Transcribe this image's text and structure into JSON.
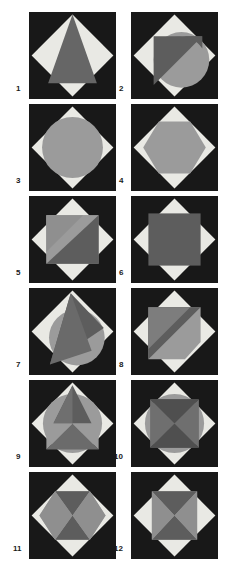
{
  "sheet": {
    "title": "Geometric figure plate",
    "columns": 2,
    "rows": 6,
    "panel_count": 12
  },
  "palette": {
    "background": "#181818",
    "page": "#ffffff",
    "light": "#e9e9e4",
    "light_alt": "#dedbd4",
    "mid_gray": "#9b9b9b",
    "mid_gray_2": "#8f8f8f",
    "dark_gray": "#666666",
    "dark_gray_2": "#5d5d5d",
    "label": "#1a1a1a"
  },
  "panels": [
    {
      "number": "1",
      "label": "1",
      "x": 29,
      "y": 12,
      "description": "dark square with light diamond and dark gray triangle",
      "shapes": [
        "diamond",
        "triangle"
      ]
    },
    {
      "number": "2",
      "label": "2",
      "x": 131,
      "y": 12,
      "description": "diamond with gray circle overlapped by dark gray triangle",
      "shapes": [
        "diamond",
        "circle",
        "triangle"
      ]
    },
    {
      "number": "3",
      "label": "3",
      "x": 29,
      "y": 104,
      "description": "diamond with large gray circle inscribed",
      "shapes": [
        "diamond",
        "circle"
      ]
    },
    {
      "number": "4",
      "label": "4",
      "x": 131,
      "y": 104,
      "description": "diamond with gray hexagon inscribed",
      "shapes": [
        "diamond",
        "hexagon"
      ]
    },
    {
      "number": "5",
      "label": "5",
      "x": 29,
      "y": 196,
      "description": "diamond with gray square split by diagonal band",
      "shapes": [
        "diamond",
        "square",
        "diagonal-band"
      ]
    },
    {
      "number": "6",
      "label": "6",
      "x": 131,
      "y": 196,
      "description": "diamond with dark gray square inscribed",
      "shapes": [
        "diamond",
        "square"
      ]
    },
    {
      "number": "7",
      "label": "7",
      "x": 29,
      "y": 288,
      "description": "diamond with gray circle overlapped by tall dark triangle",
      "shapes": [
        "diamond",
        "circle",
        "triangle"
      ]
    },
    {
      "number": "8",
      "label": "8",
      "x": 131,
      "y": 288,
      "description": "diamond with pentagon split diagonally in two grays",
      "shapes": [
        "diamond",
        "pentagon",
        "diagonal-band"
      ]
    },
    {
      "number": "9",
      "label": "9",
      "x": 29,
      "y": 380,
      "description": "diamond with circle and butterfly triangles",
      "shapes": [
        "diamond",
        "circle",
        "triangle",
        "triangle"
      ]
    },
    {
      "number": "10",
      "label": "10",
      "x": 131,
      "y": 380,
      "description": "diamond with circle and bowtie hourglass triangles",
      "shapes": [
        "diamond",
        "circle",
        "hourglass"
      ]
    },
    {
      "number": "11",
      "label": "11",
      "x": 29,
      "y": 472,
      "description": "diamond with hexagon divided into four triangles",
      "shapes": [
        "diamond",
        "hexagon",
        "cross-division"
      ]
    },
    {
      "number": "12",
      "label": "12",
      "x": 131,
      "y": 472,
      "description": "diamond with square divided into four triangles",
      "shapes": [
        "diamond",
        "square",
        "cross-division"
      ]
    }
  ],
  "labels": [
    {
      "text": "1",
      "x": 16,
      "y": 88
    },
    {
      "text": "2",
      "x": 119,
      "y": 88
    },
    {
      "text": "3",
      "x": 16,
      "y": 180
    },
    {
      "text": "4",
      "x": 119,
      "y": 180
    },
    {
      "text": "5",
      "x": 16,
      "y": 272
    },
    {
      "text": "6",
      "x": 119,
      "y": 272
    },
    {
      "text": "7",
      "x": 16,
      "y": 364
    },
    {
      "text": "8",
      "x": 119,
      "y": 364
    },
    {
      "text": "9",
      "x": 16,
      "y": 456
    },
    {
      "text": "10",
      "x": 116,
      "y": 456
    },
    {
      "text": "11",
      "x": 14,
      "y": 548
    },
    {
      "text": "12",
      "x": 116,
      "y": 548
    }
  ]
}
